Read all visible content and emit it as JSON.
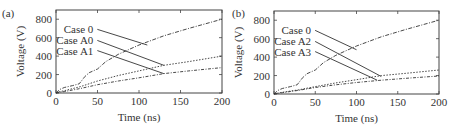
{
  "chart_data": [
    {
      "panel": "(a)",
      "type": "line",
      "xlabel": "Time (ns)",
      "ylabel": "Voltage (V)",
      "xlim": [
        0,
        200
      ],
      "ylim": [
        0,
        900
      ],
      "xticks": [
        0,
        50,
        100,
        150,
        200
      ],
      "yticks": [
        0,
        200,
        400,
        600,
        800
      ],
      "grid": false,
      "series": [
        {
          "name": "Case 0",
          "x": [
            0,
            5,
            10,
            20,
            28,
            35,
            40,
            50,
            60,
            75,
            100,
            130,
            160,
            200
          ],
          "values": [
            0,
            40,
            60,
            80,
            100,
            180,
            220,
            260,
            340,
            420,
            520,
            620,
            700,
            800
          ]
        },
        {
          "name": "Case A0",
          "x": [
            0,
            5,
            10,
            30,
            50,
            75,
            100,
            130,
            160,
            200
          ],
          "values": [
            0,
            15,
            25,
            70,
            130,
            190,
            240,
            300,
            340,
            400
          ]
        },
        {
          "name": "Case A1",
          "x": [
            0,
            5,
            10,
            30,
            50,
            75,
            100,
            130,
            160,
            200
          ],
          "values": [
            0,
            10,
            15,
            50,
            90,
            130,
            165,
            210,
            240,
            275
          ]
        }
      ],
      "annotations": [
        {
          "text": "Case 0",
          "label_xy": [
            45,
            690
          ],
          "arrow_to": [
            110,
            520
          ]
        },
        {
          "text": "Case A0",
          "label_xy": [
            45,
            570
          ],
          "arrow_to": [
            130,
            300
          ]
        },
        {
          "text": "Case A1",
          "label_xy": [
            45,
            460
          ],
          "arrow_to": [
            130,
            210
          ]
        }
      ]
    },
    {
      "panel": "(b)",
      "type": "line",
      "xlabel": "Time (ns)",
      "ylabel": "Voltage (V)",
      "xlim": [
        0,
        200
      ],
      "ylim": [
        0,
        900
      ],
      "xticks": [
        0,
        50,
        100,
        150,
        200
      ],
      "yticks": [
        0,
        200,
        400,
        600,
        800
      ],
      "grid": false,
      "series": [
        {
          "name": "Case 0",
          "x": [
            0,
            5,
            10,
            20,
            28,
            35,
            40,
            50,
            60,
            75,
            100,
            130,
            160,
            200
          ],
          "values": [
            0,
            40,
            60,
            80,
            100,
            180,
            220,
            260,
            340,
            420,
            520,
            620,
            700,
            800
          ]
        },
        {
          "name": "Case A2",
          "x": [
            0,
            5,
            10,
            30,
            50,
            75,
            100,
            130,
            160,
            200
          ],
          "values": [
            0,
            10,
            18,
            45,
            80,
            120,
            155,
            200,
            225,
            260
          ]
        },
        {
          "name": "Case A3",
          "x": [
            0,
            5,
            10,
            30,
            50,
            75,
            100,
            130,
            160,
            200
          ],
          "values": [
            0,
            8,
            14,
            40,
            70,
            100,
            125,
            150,
            170,
            195
          ]
        }
      ],
      "annotations": [
        {
          "text": "Case 0",
          "label_xy": [
            45,
            690
          ],
          "arrow_to": [
            100,
            480
          ]
        },
        {
          "text": "Case A2",
          "label_xy": [
            45,
            570
          ],
          "arrow_to": [
            130,
            190
          ]
        },
        {
          "text": "Case A3",
          "label_xy": [
            45,
            460
          ],
          "arrow_to": [
            125,
            150
          ]
        }
      ]
    }
  ]
}
